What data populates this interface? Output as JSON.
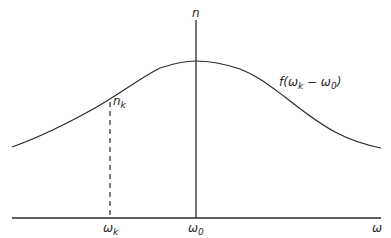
{
  "diagram": {
    "type": "distribution-curve",
    "colors": {
      "line": "#2a2a2a",
      "background": "#ffffff"
    },
    "axes": {
      "x_label": "ω",
      "y_label": "n"
    },
    "labels": {
      "center_tick": "ω",
      "center_tick_sub": "0",
      "k_tick": "ω",
      "k_tick_sub": "k",
      "point_label": "n",
      "point_label_sub": "k",
      "curve_label_prefix": "f(ω",
      "curve_label_sub1": "k",
      "curve_label_mid": " − ω",
      "curve_label_sub2": "0",
      "curve_label_suffix": ")"
    }
  }
}
